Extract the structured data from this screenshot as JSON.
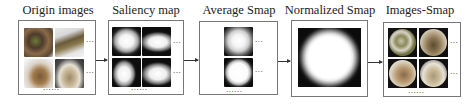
{
  "diagram": {
    "stages": [
      {
        "id": "origin",
        "title": "Origin images",
        "side_dots": [
          "...",
          "..."
        ],
        "bottom_dots": "......"
      },
      {
        "id": "saliency",
        "title": "Saliency map",
        "side_dots": [
          "...",
          "..."
        ],
        "bottom_dots": "......"
      },
      {
        "id": "average",
        "title": "Average Smap",
        "side_dots": [
          "...",
          "..."
        ],
        "bottom_dots": "......"
      },
      {
        "id": "normalized",
        "title": "Normalized Smap"
      },
      {
        "id": "images-smap",
        "title": "Images-Smap",
        "side_dots": [
          "...",
          "..."
        ],
        "bottom_dots": "......"
      }
    ],
    "arrows": [
      {
        "from": "origin",
        "to": "saliency"
      },
      {
        "from": "saliency",
        "to": "average"
      },
      {
        "from": "average",
        "to": "normalized"
      },
      {
        "from": "normalized",
        "to": "images-smap"
      }
    ],
    "colors": {
      "border": "#777777",
      "arrow": "#333333",
      "text": "#222222",
      "background": "#ffffff"
    }
  }
}
